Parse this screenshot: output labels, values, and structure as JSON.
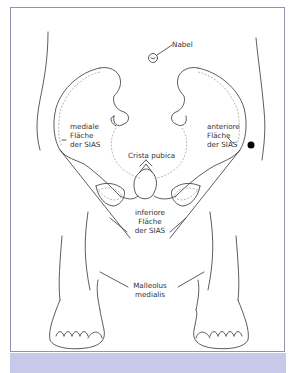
{
  "figure": {
    "colors": {
      "frame_border": "#8e93b0",
      "bottom_strip": "#c7c9ea",
      "line": "#333333",
      "dashed": "#999999",
      "marker": "#000000"
    },
    "labels": {
      "nabel": "Nabel",
      "mediale": {
        "line1": "mediale",
        "line2": "Fläche",
        "line3": "der SIAS"
      },
      "anteriore": {
        "line1": "anteriore",
        "line2": "Fläche",
        "line3": "der SIAS"
      },
      "crista": "Crista pubica",
      "inferiore": {
        "line1": "inferiore",
        "line2": "Fläche",
        "line3": "der SIAS"
      },
      "malleolus": {
        "line1": "Malleolus",
        "line2": "medialis"
      }
    }
  }
}
